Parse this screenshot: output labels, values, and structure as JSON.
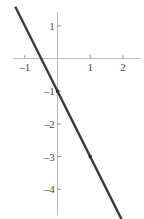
{
  "chart_data": {
    "type": "line",
    "title": "",
    "subtitle": "",
    "xlabel": "",
    "ylabel": "",
    "xlim": [
      -1.37,
      2.57
    ],
    "ylim": [
      -4.86,
      1.44
    ],
    "grid": false,
    "legend": null,
    "equation": "y = -2x - 1",
    "slope": -2,
    "intercept": -1,
    "x_ticks": [
      -1,
      1,
      2
    ],
    "x_tick_labels": [
      "-1",
      "1",
      "2"
    ],
    "y_ticks": [
      1,
      -1,
      -2,
      -3,
      -4
    ],
    "y_tick_labels": [
      "1",
      "-1",
      "-2",
      "-3",
      "-4"
    ],
    "series": [
      {
        "name": "line",
        "type": "line",
        "color": "#3a3a3a",
        "width": 2.4,
        "x": [
          -1.29,
          2.0
        ],
        "y": [
          1.58,
          -5.0
        ]
      },
      {
        "name": "marked-points",
        "type": "scatter",
        "color": "#2d2d2d",
        "marker_size": 3,
        "points": [
          {
            "x": 0,
            "y": -1,
            "label": "(0, -1)"
          },
          {
            "x": 1,
            "y": -3,
            "label": "(1, -3)"
          }
        ]
      }
    ],
    "axis_color": "#b9b9b9",
    "tick_color": "#9a9a9a",
    "label_color": "#4a4a4a",
    "background": "#ffffff"
  },
  "axes": {
    "x_axis_name": "x-axis",
    "y_axis_name": "y-axis"
  }
}
